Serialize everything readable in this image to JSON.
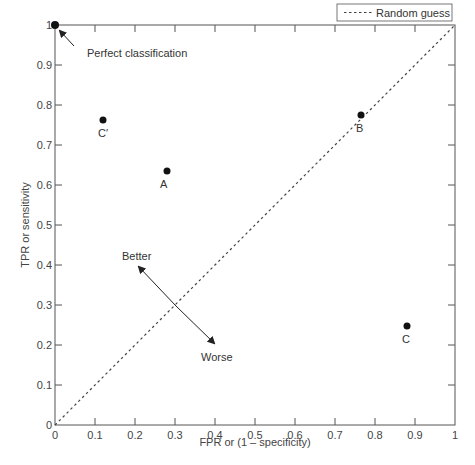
{
  "chart_data": {
    "type": "scatter",
    "title": "",
    "xlabel": "FPR or (1 – specificity)",
    "ylabel": "TPR or sensitivity",
    "xlim": [
      0,
      1
    ],
    "ylim": [
      0,
      1
    ],
    "grid": false,
    "x_ticks": [
      "0",
      "0.1",
      "0.2",
      "0.3",
      "0.4",
      "0.5",
      "0.6",
      "0.7",
      "0.8",
      "0.9",
      "1"
    ],
    "y_ticks": [
      "0",
      "0.1",
      "0.2",
      "0.3",
      "0.4",
      "0.5",
      "0.6",
      "0.7",
      "0.8",
      "0.9",
      "1"
    ],
    "points": [
      {
        "label": "",
        "x": 0.0,
        "y": 1.0
      },
      {
        "label": "C′",
        "x": 0.12,
        "y": 0.76
      },
      {
        "label": "A",
        "x": 0.28,
        "y": 0.63
      },
      {
        "label": "B",
        "x": 0.76,
        "y": 0.77
      },
      {
        "label": "C",
        "x": 0.88,
        "y": 0.24
      }
    ],
    "series": [
      {
        "name": "Random guess",
        "style": "dashed",
        "x": [
          0,
          1
        ],
        "y": [
          0,
          1
        ]
      }
    ],
    "legend": {
      "position": "top-right",
      "entries": [
        "Random guess"
      ]
    },
    "annotations": [
      {
        "text": "Perfect classification",
        "points_to": [
          0,
          1
        ]
      },
      {
        "text": "Better",
        "direction": "up-left"
      },
      {
        "text": "Worse",
        "direction": "down-right"
      }
    ]
  },
  "labels": {
    "xlabel": "FPR or (1 – specificity)",
    "ylabel": "TPR or sensitivity",
    "legend_random": "Random guess",
    "perfect": "Perfect classification",
    "better": "Better",
    "worse": "Worse",
    "pt_cprime": "C′",
    "pt_a": "A",
    "pt_b": "B",
    "pt_c": "C"
  }
}
